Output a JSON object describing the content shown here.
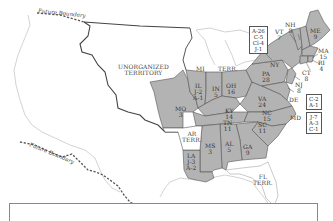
{
  "map": {
    "colors": {
      "state_fill": "#b3b3b3",
      "state_stroke": "#555555",
      "territory_fill": "#ffffff",
      "border_stroke": "#444444",
      "coast_stroke": "#bbbbbb",
      "future_boundary": "#555555"
    },
    "future_boundary_labels": [
      "Future Boundary",
      "Future Boundary"
    ],
    "territories": [
      {
        "id": "unorganized",
        "lines": [
          "UNORGANIZED",
          "TERRITORY"
        ]
      },
      {
        "id": "mi-terr-mi",
        "lines": [
          "MI"
        ]
      },
      {
        "id": "mi-terr-terr",
        "lines": [
          "TERR."
        ]
      },
      {
        "id": "ar-terr",
        "lines": [
          "AR",
          "TERR."
        ]
      },
      {
        "id": "fl-terr",
        "lines": [
          "FL",
          "TERR."
        ]
      }
    ],
    "states": [
      {
        "abbr": "ME",
        "votes": [
          "9"
        ]
      },
      {
        "abbr": "NH",
        "votes": [
          "8"
        ]
      },
      {
        "abbr": "VT",
        "votes": [
          "7"
        ]
      },
      {
        "abbr": "MA",
        "votes": [
          "15"
        ]
      },
      {
        "abbr": "RI",
        "votes": [
          "4"
        ]
      },
      {
        "abbr": "CT",
        "votes": [
          "8"
        ]
      },
      {
        "abbr": "NY",
        "votes": []
      },
      {
        "abbr": "NJ",
        "votes": [
          "8"
        ]
      },
      {
        "abbr": "PA",
        "votes": [
          "28"
        ]
      },
      {
        "abbr": "DE",
        "votes": []
      },
      {
        "abbr": "MD",
        "votes": []
      },
      {
        "abbr": "VA",
        "votes": [
          "24"
        ]
      },
      {
        "abbr": "NC",
        "votes": [
          "15"
        ]
      },
      {
        "abbr": "SC",
        "votes": [
          "11"
        ]
      },
      {
        "abbr": "GA",
        "votes": [
          "9"
        ]
      },
      {
        "abbr": "AL",
        "votes": [
          "5"
        ]
      },
      {
        "abbr": "MS",
        "votes": [
          "3"
        ]
      },
      {
        "abbr": "LA",
        "votes": [
          "J-3",
          "A-2"
        ]
      },
      {
        "abbr": "TN",
        "votes": [
          "11"
        ]
      },
      {
        "abbr": "KY",
        "votes": [
          "14"
        ]
      },
      {
        "abbr": "OH",
        "votes": [
          "16"
        ]
      },
      {
        "abbr": "IN",
        "votes": [
          "5"
        ]
      },
      {
        "abbr": "IL",
        "votes": [
          "J-2",
          "A-1"
        ]
      },
      {
        "abbr": "MO",
        "votes": [
          "3"
        ]
      }
    ],
    "split_boxes": [
      {
        "state": "NY",
        "lines": [
          "A-26",
          "C-5",
          "Cl-4",
          "J-1"
        ]
      },
      {
        "state": "DE",
        "lines": [
          "C-2",
          "A-1"
        ]
      },
      {
        "state": "MD",
        "lines": [
          "J-7",
          "A-3",
          "C-1"
        ]
      }
    ]
  }
}
